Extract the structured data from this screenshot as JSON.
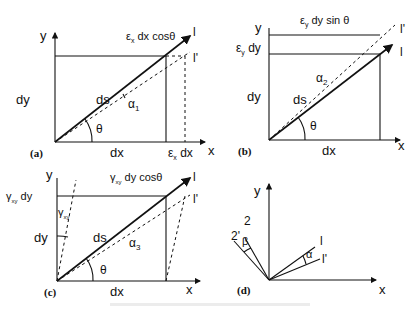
{
  "figure": {
    "panels": [
      {
        "id": "a",
        "tag": "(a)",
        "y_axis": "y",
        "x_axis": "x",
        "height_label": "dy",
        "width_label": "dx",
        "diag_label": "ds",
        "angle_theta": "θ",
        "angle_alpha": "α",
        "alpha_sub": "1",
        "top_label_e": "ε",
        "top_label_sub": "x",
        "top_label_rest": " dx cosθ",
        "extra_e": "ε",
        "extra_sub": "x",
        "extra_rest": " dx",
        "line_l": "l",
        "line_l_prime": "l'"
      },
      {
        "id": "b",
        "tag": "(b)",
        "y_axis": "y",
        "x_axis": "x",
        "height_label": "dy",
        "width_label": "dx",
        "diag_label": "ds",
        "angle_theta": "θ",
        "angle_alpha": "α",
        "alpha_sub": "2",
        "top_label_e": "ε",
        "top_label_sub": "y",
        "top_label_rest": " dy sin θ",
        "side_e": "ε",
        "side_sub": "y",
        "side_rest": " dy",
        "line_l": "l",
        "line_l_prime": "l'"
      },
      {
        "id": "c",
        "tag": "(c)",
        "y_axis": "y",
        "x_axis": "x",
        "height_label": "dy",
        "width_label": "dx",
        "diag_label": "ds",
        "angle_theta": "θ",
        "angle_alpha": "α",
        "alpha_sub": "3",
        "top_label_g": "γ",
        "top_label_sub": "xy",
        "top_label_rest": " dy cosθ",
        "side_g": "γ",
        "side_sub": "xy",
        "side_rest": " dy",
        "gamma": "γ",
        "gamma_sub": "xy",
        "line_l": "l",
        "line_l_prime": "l'"
      },
      {
        "id": "d",
        "tag": "(d)",
        "y_axis": "y",
        "x_axis": "x",
        "line_1": "l",
        "line_1_prime": "l'",
        "line_2": "2",
        "line_2_prime": "2'",
        "angle_alpha": "α",
        "angle_beta": "β"
      }
    ]
  }
}
